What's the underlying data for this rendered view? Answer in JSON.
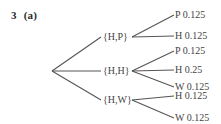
{
  "question": {
    "number": "3",
    "part": "(a)"
  },
  "tree": {
    "root": {
      "x": 52,
      "y": 71
    },
    "branches": [
      {
        "label": "{H,P}",
        "x": 103,
        "y": 37,
        "anchor_in": 101,
        "anchor_out": 132,
        "leaves": [
          {
            "label": "P 0.125",
            "outcome": "P",
            "probability": "0.125",
            "y": 15
          },
          {
            "label": "H 0.125",
            "outcome": "H",
            "probability": "0.125",
            "y": 36
          }
        ]
      },
      {
        "label": "{H,H}",
        "x": 103,
        "y": 71,
        "anchor_in": 101,
        "anchor_out": 132,
        "leaves": [
          {
            "label": "P 0.125",
            "outcome": "P",
            "probability": "0.125",
            "y": 51
          },
          {
            "label": "H 0.25",
            "outcome": "H",
            "probability": "0.25",
            "y": 70
          },
          {
            "label": "W 0.125",
            "outcome": "W",
            "probability": "0.125",
            "y": 87
          }
        ]
      },
      {
        "label": "{H,W}",
        "x": 103,
        "y": 100,
        "anchor_in": 101,
        "anchor_out": 132,
        "leaves": [
          {
            "label": "H 0.125",
            "outcome": "H",
            "probability": "0.125",
            "y": 96
          },
          {
            "label": "W 0.125",
            "outcome": "W",
            "probability": "0.125",
            "y": 118
          }
        ]
      }
    ],
    "leaf_x": 175,
    "line_color": "#555555"
  }
}
